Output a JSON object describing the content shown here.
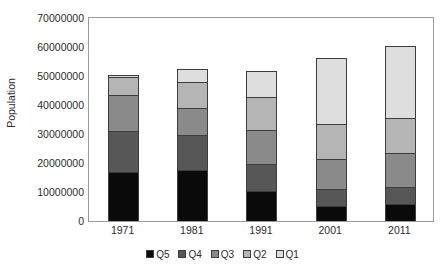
{
  "chart_data": {
    "type": "bar",
    "subtype": "stacked-bar",
    "title": "",
    "xlabel": "",
    "ylabel": "Population",
    "categories": [
      "1971",
      "1981",
      "1991",
      "2001",
      "2011"
    ],
    "ylim": [
      0,
      70000000
    ],
    "yticks": [
      0,
      10000000,
      20000000,
      30000000,
      40000000,
      50000000,
      60000000,
      70000000
    ],
    "ytick_labels": [
      "0",
      "10000000",
      "20000000",
      "30000000",
      "40000000",
      "50000000",
      "60000000",
      "70000000"
    ],
    "grid": false,
    "legend_position": "bottom",
    "stack_order_bottom_to_top": [
      "Q5",
      "Q4",
      "Q3",
      "Q2",
      "Q1"
    ],
    "series": [
      {
        "name": "Q5",
        "color": "#0a0a0a",
        "values": [
          17000000,
          17500000,
          10300000,
          5200000,
          5800000
        ]
      },
      {
        "name": "Q4",
        "color": "#575757",
        "values": [
          14000000,
          12000000,
          9300000,
          5800000,
          5800000
        ]
      },
      {
        "name": "Q3",
        "color": "#8a8a8a",
        "values": [
          12500000,
          9300000,
          11700000,
          10300000,
          12000000
        ]
      },
      {
        "name": "Q2",
        "color": "#b5b5b5",
        "values": [
          6000000,
          9300000,
          11300000,
          12000000,
          12000000
        ]
      },
      {
        "name": "Q1",
        "color": "#dedede",
        "values": [
          1000000,
          4400000,
          9000000,
          23000000,
          24700000
        ]
      }
    ],
    "totals": [
      50500000,
      52500000,
      51600000,
      56300000,
      60300000
    ]
  },
  "legend": {
    "items": [
      {
        "label": "Q5",
        "color": "#0a0a0a"
      },
      {
        "label": "Q4",
        "color": "#575757"
      },
      {
        "label": "Q3",
        "color": "#8a8a8a"
      },
      {
        "label": "Q2",
        "color": "#b5b5b5"
      },
      {
        "label": "Q1",
        "color": "#dedede"
      }
    ]
  },
  "axis": {
    "y_title": "Population"
  }
}
